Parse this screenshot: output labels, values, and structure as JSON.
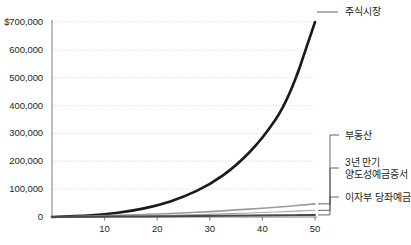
{
  "chart_data": {
    "type": "line",
    "title": "",
    "xlabel": "",
    "ylabel": "",
    "xlim": [
      0,
      52
    ],
    "ylim": [
      0,
      730000
    ],
    "grid": true,
    "legend_position": "right-inline-labels",
    "x_ticks": [
      "10",
      "20",
      "30",
      "40",
      "50"
    ],
    "x_tick_values": [
      10,
      20,
      30,
      40,
      50
    ],
    "y_ticks": [
      "$700,000",
      "600,000",
      "500,000",
      "400,000",
      "300,000",
      "200,000",
      "100,000",
      "0"
    ],
    "y_tick_values": [
      700000,
      600000,
      500000,
      400000,
      300000,
      200000,
      100000,
      0
    ],
    "x": [
      0,
      5,
      10,
      15,
      20,
      25,
      30,
      35,
      40,
      45,
      50
    ],
    "series": [
      {
        "name": "주식시장",
        "color": "#1a1a1a",
        "width": 2.6,
        "values": [
          0,
          3500,
          9500,
          21000,
          41000,
          71000,
          116000,
          183000,
          280000,
          420000,
          700000
        ]
      },
      {
        "name": "부동산",
        "color": "#a8a8a8",
        "width": 1.1,
        "values": [
          0,
          800,
          1900,
          3300,
          5000,
          7100,
          9600,
          12500,
          15900,
          19800,
          24000
        ]
      },
      {
        "name": "3년 만기\n양도성예금증서",
        "color": "#9a9a9a",
        "width": 1.6,
        "values": [
          0,
          2000,
          4400,
          7300,
          10700,
          14700,
          19400,
          24900,
          31300,
          38700,
          47000
        ]
      },
      {
        "name": "이자부 당좌예금",
        "color": "#4a4a4a",
        "width": 2.0,
        "values": [
          0,
          500,
          1100,
          1700,
          2400,
          3100,
          3900,
          4700,
          5600,
          6500,
          7500
        ]
      }
    ],
    "annotations": [
      {
        "label": "주식시장",
        "series": "주식시장",
        "at_x": 50
      },
      {
        "label": "부동산",
        "series": "부동산",
        "at_x": 50
      },
      {
        "label": "3년 만기 양도성예금증서",
        "series": "3년 만기 양도성예금증서",
        "at_x": 50
      },
      {
        "label": "이자부 당좌예금",
        "series": "이자부 당좌예금",
        "at_x": 50
      }
    ]
  },
  "labels": {
    "stock_market": "주식시장",
    "real_estate": "부동산",
    "cd_line1": "3년 만기",
    "cd_line2": "양도성예금증서",
    "checking": "이자부 당좌예금"
  },
  "colors": {
    "background": "#ffffff",
    "text": "#231f20",
    "grid": "#c9c9c9",
    "axis": "#6e6e6e",
    "stock": "#1a1a1a",
    "realestate": "#a8a8a8",
    "cd": "#9a9a9a",
    "checking": "#4a4a4a",
    "leader": "#555555"
  }
}
